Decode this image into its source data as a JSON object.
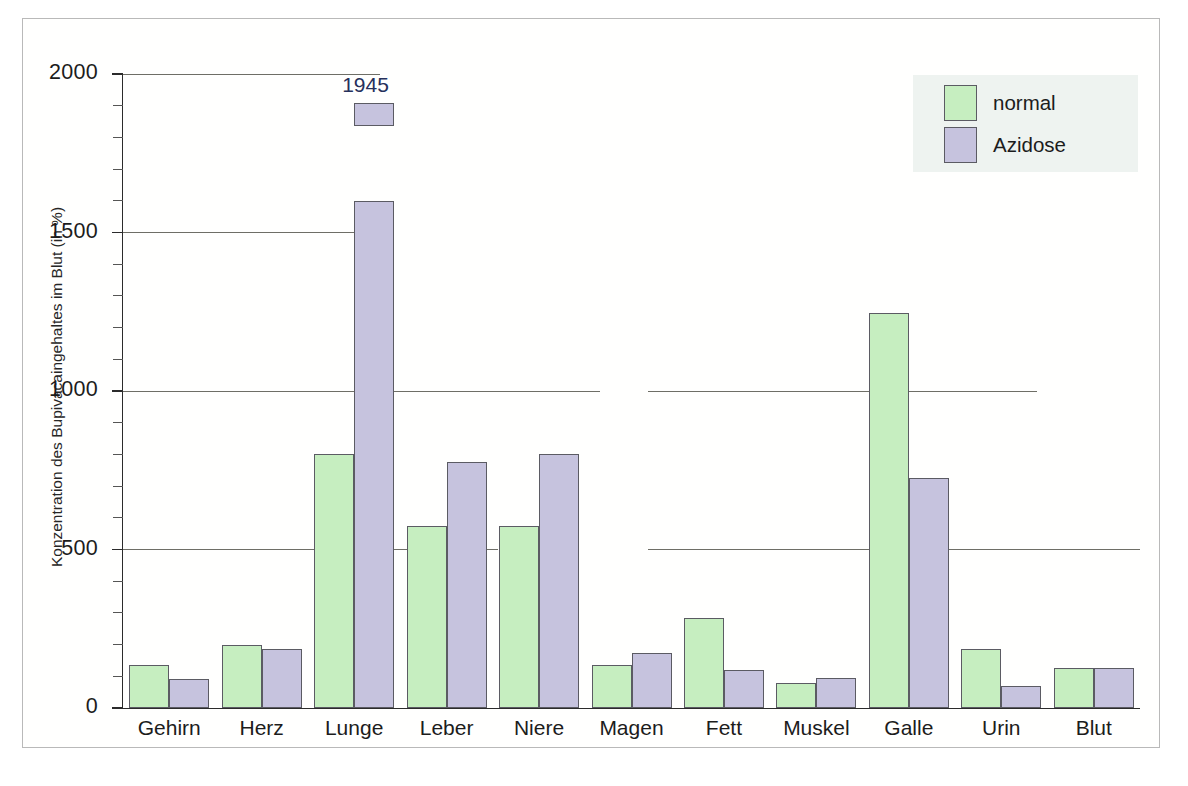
{
  "chart_data": {
    "type": "bar",
    "title": "",
    "subtitle": "",
    "xlabel": "",
    "ylabel": "Konzentration des Bupivacaingehaltes im Blut (in %)",
    "ylim": [
      0,
      2000
    ],
    "ytick_labels": [
      "0",
      "500",
      "1000",
      "1500",
      "2000"
    ],
    "ytick_values": [
      0,
      500,
      1000,
      1500,
      2000
    ],
    "minor_tick_interval": 100,
    "grid": "horizontal-major-interrupted",
    "legend_position": "top-right",
    "categories": [
      "Gehirn",
      "Herz",
      "Lunge",
      "Leber",
      "Niere",
      "Magen",
      "Fett",
      "Muskel",
      "Galle",
      "Urin",
      "Blut"
    ],
    "series": [
      {
        "name": "normal",
        "color": "#c6eec0",
        "values": [
          135,
          200,
          800,
          575,
          575,
          135,
          285,
          80,
          1245,
          185,
          125
        ]
      },
      {
        "name": "Azidose",
        "color": "#c6c3de",
        "values": [
          90,
          185,
          1945,
          775,
          800,
          175,
          120,
          95,
          725,
          70,
          125
        ]
      }
    ],
    "annotations": [
      {
        "text": "1945",
        "category": "Lunge",
        "series": "Azidose",
        "value": 1945,
        "color": "#26305c",
        "note": "bar drawn with axis break: main segment to ~1600, detached cap segment near 1945"
      }
    ],
    "broken_bar": {
      "category": "Lunge",
      "series": "Azidose",
      "main_segment_top": 1600,
      "cap_segment_bottom": 1835,
      "cap_segment_top": 1910
    }
  },
  "legend": {
    "items": [
      {
        "label": "normal",
        "color": "#c6eec0"
      },
      {
        "label": "Azidose",
        "color": "#c6c3de"
      }
    ]
  }
}
